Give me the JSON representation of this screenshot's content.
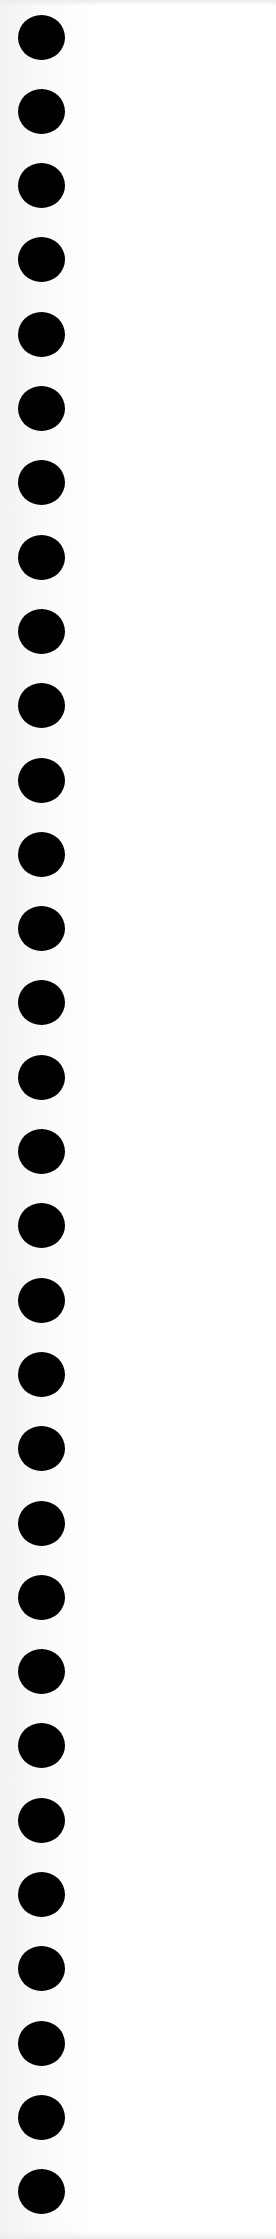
{
  "sheet": {
    "background": "#ffffff",
    "edge_tint": "#f1f1f1"
  },
  "holes": {
    "count": 30,
    "color": "#000000",
    "center_x": 41,
    "first_center_y": 37,
    "spacing": 74.3,
    "diameter_w": 47,
    "diameter_h": 45
  }
}
